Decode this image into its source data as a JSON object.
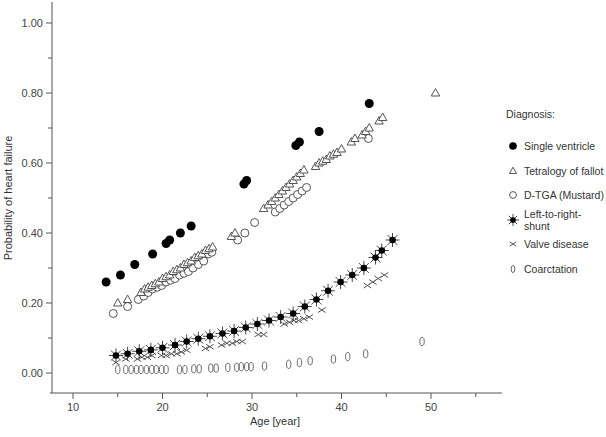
{
  "chart_data": {
    "type": "scatter",
    "title": "",
    "xlabel": "Age [year]",
    "ylabel": "Probability of heart failure",
    "xlim": [
      7.5,
      57
    ],
    "ylim": [
      -0.06,
      1.05
    ],
    "x_ticks": [
      "10",
      "20",
      "30",
      "40",
      "50"
    ],
    "y_ticks": [
      "0.00",
      "0.20",
      "0.40",
      "0.60",
      "0.80",
      "1.00"
    ],
    "grid": false,
    "legend_title": "Diagnosis:",
    "legend_position": "right",
    "series": [
      {
        "name": "Single ventricle",
        "marker": "filled-circle",
        "x": [
          13.7,
          15.3,
          16.9,
          18.9,
          20.4,
          20.8,
          22.0,
          23.2,
          29.1,
          29.4,
          34.9,
          35.3,
          37.5,
          43.1
        ],
        "y": [
          0.26,
          0.28,
          0.31,
          0.34,
          0.37,
          0.38,
          0.4,
          0.42,
          0.54,
          0.55,
          0.65,
          0.66,
          0.69,
          0.77
        ]
      },
      {
        "name": "Tetralogy of fallot",
        "marker": "open-triangle",
        "x": [
          15.0,
          16.1,
          17.6,
          18.0,
          18.4,
          18.8,
          19.2,
          19.6,
          20.0,
          20.4,
          20.8,
          21.2,
          21.6,
          22.0,
          22.4,
          22.8,
          23.2,
          23.6,
          24.0,
          24.4,
          24.8,
          25.2,
          25.6,
          27.7,
          28.1,
          31.3,
          31.8,
          32.2,
          32.6,
          33.0,
          33.4,
          33.8,
          34.2,
          34.6,
          35.0,
          35.4,
          35.8,
          37.1,
          37.5,
          37.9,
          38.3,
          38.7,
          39.1,
          39.5,
          40.0,
          41.1,
          41.5,
          42.3,
          42.7,
          43.1,
          44.2,
          44.6,
          50.5
        ],
        "y": [
          0.2,
          0.21,
          0.23,
          0.24,
          0.245,
          0.25,
          0.255,
          0.26,
          0.27,
          0.275,
          0.28,
          0.29,
          0.295,
          0.3,
          0.31,
          0.315,
          0.32,
          0.33,
          0.335,
          0.34,
          0.35,
          0.355,
          0.36,
          0.39,
          0.4,
          0.47,
          0.48,
          0.49,
          0.5,
          0.51,
          0.52,
          0.53,
          0.54,
          0.55,
          0.56,
          0.57,
          0.58,
          0.59,
          0.6,
          0.605,
          0.61,
          0.62,
          0.625,
          0.63,
          0.64,
          0.66,
          0.67,
          0.68,
          0.69,
          0.7,
          0.72,
          0.73,
          0.8
        ]
      },
      {
        "name": "D-TGA (Mustard)",
        "marker": "open-circle",
        "x": [
          14.5,
          16.1,
          17.3,
          17.9,
          18.4,
          18.9,
          19.4,
          19.9,
          20.4,
          20.9,
          21.4,
          21.9,
          22.4,
          22.9,
          23.4,
          24.0,
          24.6,
          25.1,
          25.5,
          28.4,
          29.2,
          30.3,
          32.6,
          33.1,
          33.6,
          34.1,
          34.6,
          35.1,
          35.6,
          36.1,
          43.0
        ],
        "y": [
          0.17,
          0.19,
          0.21,
          0.22,
          0.23,
          0.24,
          0.245,
          0.25,
          0.26,
          0.265,
          0.27,
          0.28,
          0.285,
          0.29,
          0.3,
          0.31,
          0.32,
          0.34,
          0.345,
          0.38,
          0.4,
          0.43,
          0.46,
          0.47,
          0.48,
          0.49,
          0.5,
          0.51,
          0.52,
          0.53,
          0.67
        ]
      },
      {
        "name": "Left-to-right-shunt",
        "marker": "filled-star",
        "x": [
          14.8,
          16.1,
          17.4,
          18.7,
          20.0,
          21.4,
          22.7,
          24.0,
          25.3,
          26.7,
          28.0,
          29.3,
          30.6,
          31.9,
          33.2,
          34.6,
          35.9,
          37.2,
          38.5,
          39.9,
          41.2,
          42.5,
          43.8,
          44.5,
          45.7
        ],
        "y": [
          0.05,
          0.055,
          0.062,
          0.066,
          0.072,
          0.08,
          0.09,
          0.098,
          0.105,
          0.113,
          0.12,
          0.13,
          0.14,
          0.15,
          0.16,
          0.17,
          0.19,
          0.21,
          0.235,
          0.26,
          0.28,
          0.3,
          0.33,
          0.35,
          0.38
        ]
      },
      {
        "name": "Valve disease",
        "marker": "cross-x",
        "x": [
          14.8,
          15.9,
          17.2,
          17.7,
          18.3,
          18.8,
          19.9,
          20.4,
          21.0,
          21.6,
          22.1,
          22.7,
          24.8,
          25.3,
          26.6,
          27.2,
          27.8,
          28.3,
          28.9,
          30.7,
          31.3,
          33.6,
          34.2,
          34.7,
          35.2,
          35.8,
          36.4,
          37.8,
          42.9,
          43.5,
          44.1,
          44.8
        ],
        "y": [
          0.03,
          0.04,
          0.04,
          0.045,
          0.045,
          0.05,
          0.05,
          0.05,
          0.055,
          0.055,
          0.06,
          0.065,
          0.07,
          0.075,
          0.08,
          0.085,
          0.085,
          0.09,
          0.09,
          0.11,
          0.11,
          0.14,
          0.145,
          0.15,
          0.15,
          0.155,
          0.16,
          0.18,
          0.25,
          0.26,
          0.27,
          0.28
        ]
      },
      {
        "name": "Coarctation",
        "marker": "open-ellipse",
        "x": [
          15.0,
          15.9,
          16.5,
          17.1,
          17.6,
          18.2,
          18.8,
          19.3,
          19.9,
          20.4,
          21.9,
          22.5,
          23.5,
          24.1,
          25.4,
          26.0,
          27.3,
          28.3,
          28.8,
          29.4,
          29.9,
          31.4,
          34.1,
          35.3,
          36.5,
          39.1,
          40.7,
          42.7,
          49.0
        ],
        "y": [
          0.01,
          0.01,
          0.01,
          0.01,
          0.01,
          0.01,
          0.01,
          0.01,
          0.01,
          0.01,
          0.01,
          0.01,
          0.012,
          0.012,
          0.014,
          0.014,
          0.016,
          0.016,
          0.018,
          0.018,
          0.018,
          0.02,
          0.025,
          0.03,
          0.035,
          0.04,
          0.047,
          0.055,
          0.09
        ]
      }
    ]
  }
}
